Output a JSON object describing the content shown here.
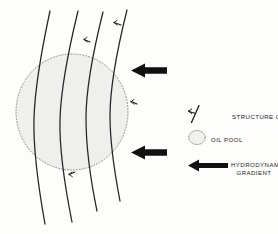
{
  "figure": {
    "background_color": "#fdfdfc",
    "line_color": "#1f1f1f",
    "oil_pool_fill": "#efefee",
    "oil_pool_outline_color": "#6e6e6c",
    "arrow_color": "#121212"
  },
  "legend": {
    "items": [
      {
        "symbol": "structure-contour-symbol",
        "label": "STRUCTURE  CONTOURS"
      },
      {
        "symbol": "oil-pool-symbol",
        "label": "OIL  POOL"
      },
      {
        "symbol": "hydrodynamic-gradient-arrow",
        "label_line1": "HYDRODYNAMIC",
        "label_line2": "GRADIENT"
      }
    ]
  },
  "map": {
    "contours": [
      {
        "name": "structure-contour-1"
      },
      {
        "name": "structure-contour-2"
      },
      {
        "name": "structure-contour-3"
      },
      {
        "name": "structure-contour-4"
      }
    ],
    "dip_ticks": [
      {
        "name": "dip-tick-top-right"
      },
      {
        "name": "dip-tick-upper"
      },
      {
        "name": "dip-tick-middle"
      },
      {
        "name": "dip-tick-lower"
      }
    ],
    "oil_pool": {
      "name": "oil-pool-outline"
    },
    "gradient_arrows": [
      {
        "name": "gradient-arrow-upper",
        "direction": "left"
      },
      {
        "name": "gradient-arrow-lower",
        "direction": "left"
      }
    ]
  }
}
